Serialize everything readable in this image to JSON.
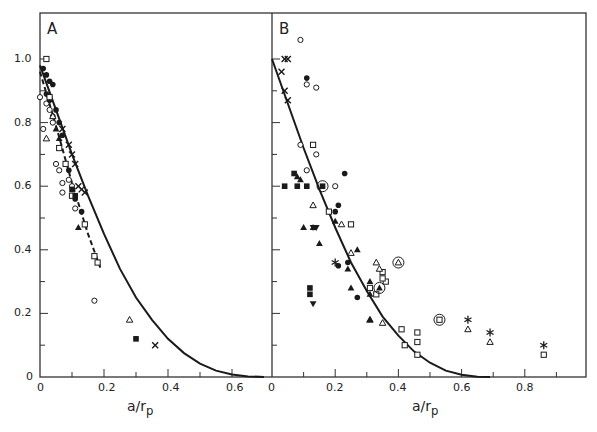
{
  "chart_data": [
    {
      "type": "scatter",
      "panel": "A",
      "xlabel": "a/r_p",
      "ylabel": "",
      "xlim": [
        0,
        0.72
      ],
      "ylim": [
        0,
        1.1
      ],
      "xticks": [
        "0",
        "0.2",
        "0.4",
        "0.6"
      ],
      "yticks": [
        "0",
        "0.2",
        "0.4",
        "0.6",
        "0.8",
        "1.0"
      ],
      "grid": false,
      "curves": [
        {
          "name": "solid theory",
          "style": "solid",
          "x": [
            0,
            0.05,
            0.1,
            0.15,
            0.2,
            0.25,
            0.3,
            0.35,
            0.4,
            0.45,
            0.5,
            0.55,
            0.6,
            0.65,
            0.7
          ],
          "y": [
            0.98,
            0.84,
            0.7,
            0.57,
            0.45,
            0.34,
            0.25,
            0.18,
            0.12,
            0.075,
            0.042,
            0.02,
            0.008,
            0.002,
            0
          ]
        },
        {
          "name": "dashed fit",
          "style": "dashed",
          "x": [
            0,
            0.05,
            0.1,
            0.15,
            0.19
          ],
          "y": [
            0.96,
            0.79,
            0.61,
            0.45,
            0.34
          ]
        }
      ],
      "series": [
        {
          "name": "open circle",
          "marker": "circle-open",
          "points": [
            [
              0.0,
              0.88
            ],
            [
              0.02,
              0.86
            ],
            [
              0.01,
              0.78
            ],
            [
              0.05,
              0.67
            ],
            [
              0.06,
              0.65
            ],
            [
              0.07,
              0.61
            ],
            [
              0.07,
              0.58
            ],
            [
              0.09,
              0.62
            ],
            [
              0.1,
              0.6
            ],
            [
              0.11,
              0.53
            ],
            [
              0.17,
              0.24
            ],
            [
              0.03,
              0.84
            ],
            [
              0.04,
              0.8
            ]
          ]
        },
        {
          "name": "filled circle",
          "marker": "circle-filled",
          "points": [
            [
              0.01,
              0.97
            ],
            [
              0.02,
              0.95
            ],
            [
              0.03,
              0.93
            ],
            [
              0.04,
              0.92
            ],
            [
              0.02,
              0.89
            ],
            [
              0.03,
              0.87
            ],
            [
              0.05,
              0.84
            ],
            [
              0.06,
              0.8
            ],
            [
              0.04,
              0.82
            ],
            [
              0.07,
              0.76
            ],
            [
              0.09,
              0.65
            ],
            [
              0.11,
              0.56
            ],
            [
              0.13,
              0.52
            ]
          ]
        },
        {
          "name": "open square",
          "marker": "square-open",
          "points": [
            [
              0.02,
              1.0
            ],
            [
              0.03,
              0.88
            ],
            [
              0.06,
              0.72
            ],
            [
              0.08,
              0.67
            ],
            [
              0.1,
              0.57
            ],
            [
              0.14,
              0.48
            ],
            [
              0.17,
              0.38
            ],
            [
              0.18,
              0.36
            ]
          ]
        },
        {
          "name": "filled square",
          "marker": "square-filled",
          "points": [
            [
              0.1,
              0.59
            ],
            [
              0.11,
              0.57
            ],
            [
              0.3,
              0.12
            ]
          ]
        },
        {
          "name": "open triangle",
          "marker": "triangle-open",
          "points": [
            [
              0.02,
              0.75
            ],
            [
              0.04,
              0.82
            ],
            [
              0.28,
              0.18
            ]
          ]
        },
        {
          "name": "filled triangle",
          "marker": "triangle-filled",
          "points": [
            [
              0.05,
              0.78
            ],
            [
              0.06,
              0.75
            ],
            [
              0.12,
              0.47
            ]
          ]
        },
        {
          "name": "cross",
          "marker": "x",
          "points": [
            [
              0.07,
              0.78
            ],
            [
              0.09,
              0.73
            ],
            [
              0.1,
              0.7
            ],
            [
              0.11,
              0.67
            ],
            [
              0.12,
              0.6
            ],
            [
              0.13,
              0.59
            ],
            [
              0.14,
              0.58
            ],
            [
              0.36,
              0.1
            ]
          ]
        }
      ],
      "annotations": [
        "A"
      ]
    },
    {
      "type": "scatter",
      "panel": "B",
      "xlabel": "a/r_p",
      "ylabel": "",
      "xlim": [
        0,
        1.0
      ],
      "ylim": [
        0,
        1.1
      ],
      "xticks": [
        "0",
        "0.2",
        "0.4",
        "0.6",
        "0.8"
      ],
      "yticks": [],
      "grid": false,
      "curves": [
        {
          "name": "solid theory",
          "style": "solid",
          "x": [
            0,
            0.05,
            0.1,
            0.15,
            0.2,
            0.25,
            0.3,
            0.35,
            0.4,
            0.45,
            0.5,
            0.55,
            0.6,
            0.65,
            0.69
          ],
          "y": [
            1.0,
            0.86,
            0.72,
            0.59,
            0.47,
            0.36,
            0.27,
            0.19,
            0.13,
            0.08,
            0.045,
            0.02,
            0.007,
            0.001,
            0
          ]
        }
      ],
      "series": [
        {
          "name": "open circle",
          "marker": "circle-open",
          "points": [
            [
              0.09,
              1.06
            ],
            [
              0.11,
              0.92
            ],
            [
              0.14,
              0.91
            ],
            [
              0.09,
              0.73
            ],
            [
              0.14,
              0.7
            ],
            [
              0.2,
              0.6
            ],
            [
              0.11,
              0.65
            ]
          ]
        },
        {
          "name": "filled circle",
          "marker": "circle-filled",
          "points": [
            [
              0.11,
              0.94
            ],
            [
              0.23,
              0.64
            ],
            [
              0.21,
              0.54
            ],
            [
              0.2,
              0.52
            ],
            [
              0.24,
              0.36
            ],
            [
              0.21,
              0.35
            ],
            [
              0.27,
              0.25
            ]
          ]
        },
        {
          "name": "open square",
          "marker": "square-open",
          "points": [
            [
              0.13,
              0.73
            ],
            [
              0.18,
              0.52
            ],
            [
              0.25,
              0.48
            ],
            [
              0.31,
              0.28
            ],
            [
              0.33,
              0.26
            ],
            [
              0.35,
              0.33
            ],
            [
              0.36,
              0.3
            ],
            [
              0.41,
              0.15
            ],
            [
              0.46,
              0.14
            ],
            [
              0.46,
              0.11
            ],
            [
              0.42,
              0.1
            ],
            [
              0.46,
              0.07
            ],
            [
              0.86,
              0.07
            ],
            [
              0.35,
              0.31
            ]
          ]
        },
        {
          "name": "filled square",
          "marker": "square-filled",
          "points": [
            [
              0.04,
              0.6
            ],
            [
              0.08,
              0.6
            ],
            [
              0.11,
              0.6
            ],
            [
              0.07,
              0.64
            ],
            [
              0.12,
              0.28
            ],
            [
              0.12,
              0.26
            ]
          ]
        },
        {
          "name": "open triangle",
          "marker": "triangle-open",
          "points": [
            [
              0.13,
              0.54
            ],
            [
              0.22,
              0.48
            ],
            [
              0.25,
              0.39
            ],
            [
              0.33,
              0.36
            ],
            [
              0.34,
              0.34
            ],
            [
              0.31,
              0.18
            ],
            [
              0.62,
              0.15
            ],
            [
              0.69,
              0.11
            ],
            [
              0.35,
              0.17
            ]
          ]
        },
        {
          "name": "filled triangle",
          "marker": "triangle-filled",
          "points": [
            [
              0.08,
              0.63
            ],
            [
              0.09,
              0.62
            ],
            [
              0.1,
              0.47
            ],
            [
              0.2,
              0.49
            ],
            [
              0.15,
              0.42
            ],
            [
              0.27,
              0.4
            ],
            [
              0.24,
              0.34
            ],
            [
              0.25,
              0.28
            ],
            [
              0.31,
              0.3
            ],
            [
              0.31,
              0.26
            ],
            [
              0.31,
              0.18
            ],
            [
              0.13,
              0.47
            ]
          ]
        },
        {
          "name": "filled inverted triangle",
          "marker": "triangle-down-filled",
          "points": [
            [
              0.13,
              0.47
            ],
            [
              0.14,
              0.47
            ],
            [
              0.13,
              0.23
            ]
          ]
        },
        {
          "name": "cross",
          "marker": "x",
          "points": [
            [
              0.04,
              1.0
            ],
            [
              0.05,
              1.0
            ],
            [
              0.03,
              0.96
            ],
            [
              0.04,
              0.9
            ],
            [
              0.05,
              0.87
            ]
          ]
        },
        {
          "name": "asterisk",
          "marker": "asterisk",
          "points": [
            [
              0.2,
              0.36
            ],
            [
              0.62,
              0.18
            ],
            [
              0.69,
              0.14
            ],
            [
              0.86,
              0.1
            ]
          ]
        },
        {
          "name": "circled filled square",
          "marker": "circled-square-filled",
          "points": [
            [
              0.16,
              0.6
            ]
          ]
        },
        {
          "name": "circled open triangle",
          "marker": "circled-triangle-open",
          "points": [
            [
              0.4,
              0.36
            ]
          ]
        },
        {
          "name": "circled filled triangle",
          "marker": "circled-triangle-filled",
          "points": [
            [
              0.34,
              0.28
            ]
          ]
        },
        {
          "name": "circled open square",
          "marker": "circled-square-open",
          "points": [
            [
              0.53,
              0.18
            ]
          ]
        }
      ],
      "annotations": [
        "B"
      ]
    }
  ],
  "panels": {
    "a": {
      "letter": "A",
      "xlabel": "a/r",
      "xlabel_sub": "p",
      "yticks": [
        "1.0",
        "0.8",
        "0.6",
        "0.4",
        "0.2",
        "0"
      ],
      "xticks": [
        "0",
        "0.2",
        "0.4",
        "0.6"
      ]
    },
    "b": {
      "letter": "B",
      "xlabel": "a/r",
      "xlabel_sub": "p",
      "xticks": [
        "0",
        "0.2",
        "0.4",
        "0.6",
        "0.8"
      ]
    }
  },
  "colors": {
    "ink": "#1a1a1a",
    "frame": "#333333",
    "background": "#ffffff"
  }
}
